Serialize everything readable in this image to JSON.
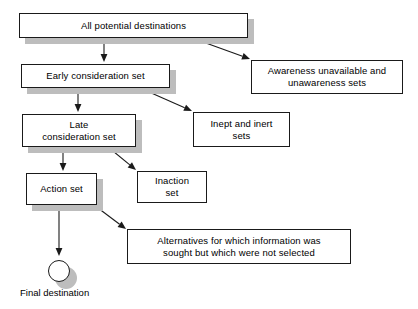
{
  "diagram": {
    "background_color": "#ffffff",
    "line_color": "#1a1a1a",
    "shadow_color": "#bdbdbd",
    "nodes": [
      {
        "id": "all-potential-destinations",
        "label": "All potential destinations",
        "x": 19,
        "y": 13,
        "w": 229,
        "h": 25,
        "shadow": true
      },
      {
        "id": "early-consideration-set",
        "label": "Early consideration set",
        "x": 21,
        "y": 64,
        "w": 149,
        "h": 24,
        "shadow": true
      },
      {
        "id": "awareness-unavailable-and-unawareness-sets",
        "label": "Awareness unavailable and\nunawareness sets",
        "x": 251,
        "y": 60,
        "w": 152,
        "h": 34,
        "shadow": false
      },
      {
        "id": "late-consideration-set",
        "label": "Late\nconsideration set",
        "x": 22,
        "y": 114,
        "w": 114,
        "h": 33,
        "shadow": true
      },
      {
        "id": "inept-and-inert-sets",
        "label": "Inept and inert\nsets",
        "x": 193,
        "y": 112,
        "w": 97,
        "h": 35,
        "shadow": false
      },
      {
        "id": "action-set",
        "label": "Action set",
        "x": 26,
        "y": 173,
        "w": 71,
        "h": 32,
        "shadow": true
      },
      {
        "id": "inaction-set",
        "label": "Inaction\nset",
        "x": 137,
        "y": 171,
        "w": 70,
        "h": 32,
        "shadow": false
      },
      {
        "id": "alternatives-not-selected",
        "label": "Alternatives for which information was\nsought but which were not selected",
        "x": 127,
        "y": 229,
        "w": 224,
        "h": 35,
        "shadow": false
      }
    ],
    "terminal": {
      "id": "final-destination-circle",
      "cx": 59,
      "cy": 271,
      "r": 11
    },
    "caption": {
      "id": "final-destination-caption",
      "text": "Final destination",
      "x": 20,
      "y": 287
    },
    "edges": [
      {
        "id": "all-to-early",
        "x1": 104,
        "y1": 38,
        "x2": 104,
        "y2": 62
      },
      {
        "id": "all-to-awareness",
        "x1": 192,
        "y1": 38,
        "x2": 250,
        "y2": 59
      },
      {
        "id": "early-to-late",
        "x1": 78,
        "y1": 88,
        "x2": 78,
        "y2": 112
      },
      {
        "id": "early-to-inept",
        "x1": 140,
        "y1": 88,
        "x2": 192,
        "y2": 111
      },
      {
        "id": "late-to-action",
        "x1": 63,
        "y1": 147,
        "x2": 63,
        "y2": 171
      },
      {
        "id": "late-to-inaction",
        "x1": 108,
        "y1": 147,
        "x2": 136,
        "y2": 170
      },
      {
        "id": "action-to-final",
        "x1": 59,
        "y1": 205,
        "x2": 59,
        "y2": 256
      },
      {
        "id": "action-to-alternatives",
        "x1": 94,
        "y1": 205,
        "x2": 126,
        "y2": 229
      }
    ]
  }
}
